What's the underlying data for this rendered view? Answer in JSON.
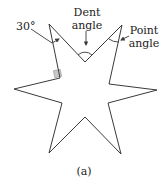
{
  "figure": {
    "labels": {
      "thirty": "30°",
      "dent_line1": "Dent",
      "dent_line2": "angle",
      "point_line1": "Point",
      "point_line2": "angle",
      "caption": "(a)"
    },
    "colors": {
      "stroke": "#3a3a3a",
      "right_angle_fill": "#c8c8c8",
      "text": "#222222"
    },
    "star_vertices": [
      [
        49,
        24
      ],
      [
        85,
        62
      ],
      [
        122,
        25
      ],
      [
        109,
        84
      ],
      [
        157,
        90
      ],
      [
        108,
        103
      ],
      [
        121,
        154
      ],
      [
        85,
        117
      ],
      [
        49,
        153
      ],
      [
        62,
        103
      ],
      [
        14,
        89
      ],
      [
        60,
        78
      ]
    ]
  }
}
